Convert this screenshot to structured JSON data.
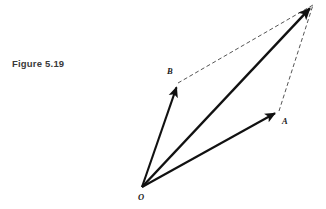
{
  "figure": {
    "caption": "Figure 5.19",
    "background_color": "#ffffff",
    "solid_stroke_color": "#111111",
    "dashed_stroke_color": "#555555",
    "label_color": "#1a1a1a",
    "width": 326,
    "height": 209
  },
  "labels": {
    "origin": "O",
    "point_a": "A",
    "point_b": "B"
  },
  "chart_data": {
    "type": "diagram",
    "title": "Figure 5.19",
    "points": [
      {
        "name": "O",
        "x": 142,
        "y": 187,
        "label": "O",
        "label_x": 138,
        "label_y": 200
      },
      {
        "name": "B",
        "x": 178,
        "y": 83,
        "label": "B",
        "label_x": 167,
        "label_y": 74
      },
      {
        "name": "A",
        "x": 279,
        "y": 111,
        "label": "A",
        "label_x": 282,
        "label_y": 124
      },
      {
        "name": "R",
        "x": 313,
        "y": 5,
        "label": "",
        "label_x": 0,
        "label_y": 0
      }
    ],
    "vectors": [
      {
        "name": "OB",
        "from": "O",
        "to": "B",
        "style": "solid",
        "arrow": true
      },
      {
        "name": "OR",
        "from": "O",
        "to": "R",
        "style": "solid",
        "arrow": true
      },
      {
        "name": "OA",
        "from": "O",
        "to": "A",
        "style": "solid",
        "arrow": true
      }
    ],
    "construction_lines": [
      {
        "name": "BR",
        "from": "B",
        "to": "R",
        "style": "dashed",
        "arrow": false
      },
      {
        "name": "AR",
        "from": "A",
        "to": "R",
        "style": "dashed",
        "arrow": false
      }
    ],
    "axis_labels": {
      "x": "",
      "y": ""
    },
    "grid": false,
    "legend": null
  }
}
